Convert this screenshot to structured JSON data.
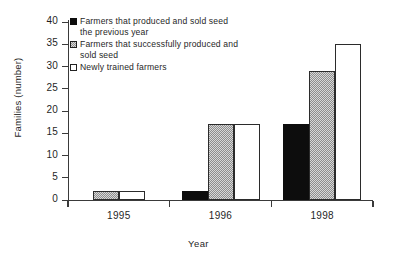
{
  "chart_data": {
    "type": "bar",
    "title": "",
    "xlabel": "Year",
    "ylabel": "Families (number)",
    "categories": [
      "1995",
      "1996",
      "1998"
    ],
    "ylim": [
      0,
      40
    ],
    "yticks": [
      0,
      5,
      10,
      15,
      20,
      25,
      30,
      35,
      40
    ],
    "ytick_labels": [
      "0",
      "5",
      "10",
      "15",
      "20",
      "25",
      "30",
      "35",
      "40"
    ],
    "grid": false,
    "legend_position": "top-left-inside",
    "series": [
      {
        "name": "Farmers that produced and sold seed\nthe previous year",
        "swatch": "solid",
        "color": "#0d0d0d",
        "values": [
          null,
          2,
          17
        ]
      },
      {
        "name": "Farmers that successfully produced and\nsold seed",
        "swatch": "stipple",
        "color": "#d8d8d8",
        "values": [
          2,
          17,
          29
        ]
      },
      {
        "name": "Newly trained farmers",
        "swatch": "hollow",
        "color": "#ffffff",
        "values": [
          2,
          17,
          35
        ]
      }
    ]
  }
}
